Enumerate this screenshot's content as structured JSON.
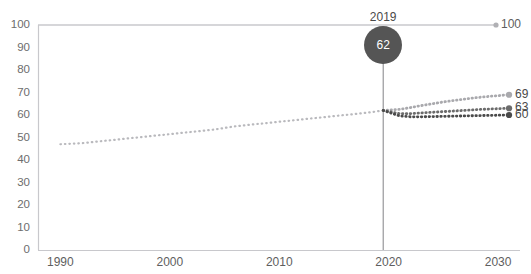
{
  "chart_data": {
    "type": "line",
    "title": "",
    "xlabel": "",
    "ylabel": "",
    "xlim": [
      1988,
      2032
    ],
    "ylim": [
      0,
      100
    ],
    "grid": false,
    "legend_position": "none",
    "y_ticks": [
      "100",
      "90",
      "80",
      "70",
      "60",
      "50",
      "40",
      "30",
      "20",
      "10",
      "0"
    ],
    "y_tick_values": [
      100,
      90,
      80,
      70,
      60,
      50,
      40,
      30,
      20,
      10,
      0
    ],
    "x_ticks": [
      "1990",
      "2000",
      "2010",
      "2020",
      "2030"
    ],
    "x_tick_values": [
      1990,
      2000,
      2010,
      2020,
      2030
    ],
    "reference_line": {
      "label": "100",
      "value": 100,
      "has_end_dot": true
    },
    "annotation": {
      "year_label": "2019",
      "value_label": "62",
      "value": 62,
      "x_value": 2019.5
    },
    "series": [
      {
        "name": "historical",
        "style": "dotted",
        "color": "#b9b9bd",
        "x": [
          1990,
          1992,
          1994,
          1996,
          1998,
          2000,
          2002,
          2004,
          2006,
          2008,
          2010,
          2012,
          2014,
          2016,
          2018,
          2019.5
        ],
        "values": [
          47,
          47.5,
          48.5,
          49.5,
          50.5,
          51.5,
          52.5,
          53.5,
          55,
          56,
          57,
          58,
          59,
          60,
          61,
          62
        ]
      },
      {
        "name": "projection-high",
        "style": "dotted",
        "color": "#a9a9ad",
        "end_label": "69",
        "x": [
          2019.5,
          2021,
          2022,
          2023,
          2024,
          2025,
          2026,
          2027,
          2028,
          2029,
          2030,
          2031
        ],
        "values": [
          62,
          62.5,
          63.3,
          64.2,
          65.0,
          65.8,
          66.5,
          67.1,
          67.7,
          68.2,
          68.6,
          69
        ]
      },
      {
        "name": "projection-mid",
        "style": "dotted",
        "color": "#6b6b6b",
        "end_label": "63",
        "x": [
          2019.5,
          2021,
          2022,
          2023,
          2024,
          2025,
          2026,
          2027,
          2028,
          2029,
          2030,
          2031
        ],
        "values": [
          62,
          60.6,
          60.6,
          60.9,
          61.2,
          61.5,
          61.8,
          62.1,
          62.4,
          62.6,
          62.8,
          63
        ]
      },
      {
        "name": "projection-low",
        "style": "dotted",
        "color": "#4a4a4a",
        "end_label": "60",
        "x": [
          2019.5,
          2021,
          2022,
          2023,
          2024,
          2025,
          2026,
          2027,
          2028,
          2029,
          2030,
          2031
        ],
        "values": [
          62,
          59.6,
          59.2,
          59.2,
          59.3,
          59.4,
          59.5,
          59.6,
          59.7,
          59.8,
          59.9,
          60
        ]
      }
    ],
    "endpoint_labels": [
      "69",
      "63",
      "60"
    ]
  },
  "colors": {
    "axis": "#c8c8cc",
    "historical_line": "#b9b9bd",
    "projection_high": "#a9a9ad",
    "projection_mid": "#6b6b6b",
    "projection_low": "#4a4a4a",
    "bubble": "#555555",
    "tick_text": "#6d6d6d",
    "background": "#ffffff"
  },
  "cut_off_text": {
    "top": "",
    "bottom": ""
  }
}
